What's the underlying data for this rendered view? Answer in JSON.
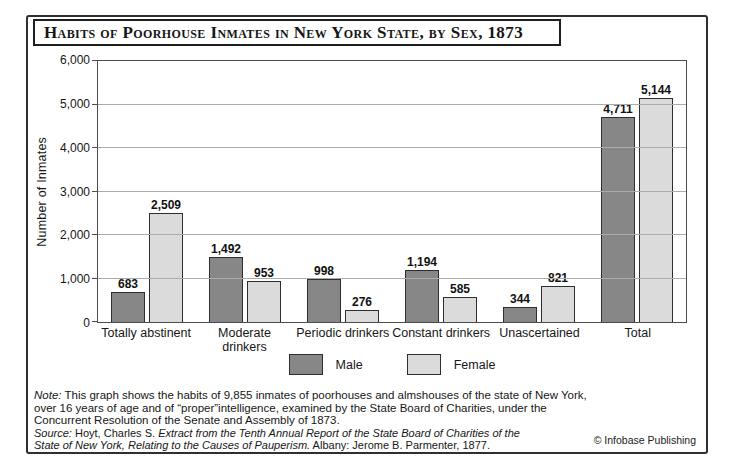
{
  "title": "Habits of Poorhouse Inmates in New York State, by Sex, 1873",
  "chart_data": {
    "type": "bar",
    "title": "Habits of Poorhouse Inmates in New York State, by Sex, 1873",
    "categories": [
      "Totally abstinent",
      "Moderate drinkers",
      "Periodic drinkers",
      "Constant drinkers",
      "Unascertained",
      "Total"
    ],
    "series": [
      {
        "name": "Male",
        "color": "#878787",
        "values": [
          683,
          1492,
          998,
          1194,
          344,
          4711
        ]
      },
      {
        "name": "Female",
        "color": "#dbdbdb",
        "values": [
          2509,
          953,
          276,
          585,
          821,
          5144
        ]
      }
    ],
    "xlabel": "",
    "ylabel": "Number of Inmates",
    "ylim": [
      0,
      6000
    ],
    "yticks": [
      0,
      1000,
      2000,
      3000,
      4000,
      5000,
      6000
    ],
    "ytick_labels": [
      "0",
      "1,000",
      "2,000",
      "3,000",
      "4,000",
      "5,000",
      "6,000"
    ],
    "grid": "horizontal",
    "legend_position": "bottom",
    "value_labels": true
  },
  "note": {
    "label": "Note:",
    "lines": [
      "This graph shows the habits of 9,855 inmates of poorhouses and almshouses of the state of New York,",
      "over 16 years of age and of “proper”intelligence, examined by the State Board of Charities, under the",
      "Concurrent Resolution of the Senate and Assembly of 1873."
    ]
  },
  "source": {
    "label": "Source:",
    "authors": " Hoyt, Charles S. ",
    "work_lines": [
      "Extract from the Tenth Annual Report of the State Board of Charities of the",
      "State of New York, Relating to the Causes of Pauperism."
    ],
    "tail": " Albany: Jerome B. Parmenter, 1877."
  },
  "copyright": "© Infobase Publishing"
}
